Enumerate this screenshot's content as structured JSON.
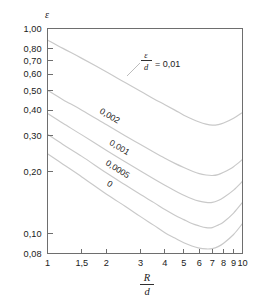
{
  "chart_data": {
    "type": "line",
    "title": "",
    "xlabel": "R/d",
    "ylabel": "ε",
    "xscale": "log",
    "yscale": "log",
    "xlim": [
      1,
      10
    ],
    "ylim": [
      0.08,
      1.0
    ],
    "grid": false,
    "legend_position": "inline-curve-labels",
    "x_tick_labels": [
      "1",
      "1,5",
      "2",
      "3",
      "4",
      "5",
      "6",
      "7",
      "8",
      "9",
      "10"
    ],
    "x_tick_values": [
      1,
      1.5,
      2,
      3,
      4,
      5,
      6,
      7,
      8,
      9,
      10
    ],
    "y_tick_labels": [
      "0,08",
      "0,10",
      "0,20",
      "0,30",
      "0,40",
      "0,50",
      "0,60",
      "0,70",
      "0,80",
      "1,00"
    ],
    "y_tick_values": [
      0.08,
      0.1,
      0.2,
      0.3,
      0.4,
      0.5,
      0.6,
      0.7,
      0.8,
      1.0
    ],
    "series": [
      {
        "name": "0,01",
        "label": "0,01",
        "label_prefix": "ε/d =",
        "x": [
          1,
          1.2,
          1.5,
          2,
          2.5,
          3,
          3.5,
          4,
          4.5,
          5,
          5.5,
          6,
          6.5,
          7,
          7.5,
          8,
          9,
          10
        ],
        "y": [
          0.88,
          0.8,
          0.715,
          0.615,
          0.545,
          0.495,
          0.455,
          0.425,
          0.4,
          0.378,
          0.362,
          0.35,
          0.342,
          0.338,
          0.34,
          0.346,
          0.365,
          0.39
        ]
      },
      {
        "name": "0,002",
        "label": "0,002",
        "x": [
          1,
          1.2,
          1.5,
          2,
          2.5,
          3,
          3.5,
          4,
          4.5,
          5,
          5.5,
          6,
          6.5,
          7,
          7.5,
          8,
          9,
          10
        ],
        "y": [
          0.5,
          0.45,
          0.4,
          0.34,
          0.3,
          0.272,
          0.25,
          0.233,
          0.22,
          0.21,
          0.202,
          0.196,
          0.193,
          0.192,
          0.194,
          0.199,
          0.212,
          0.23
        ]
      },
      {
        "name": "0,001",
        "label": "0,001",
        "x": [
          1,
          1.2,
          1.5,
          2,
          2.5,
          3,
          3.5,
          4,
          4.5,
          5,
          5.5,
          6,
          6.5,
          7,
          7.5,
          8,
          9,
          10
        ],
        "y": [
          0.385,
          0.345,
          0.303,
          0.255,
          0.224,
          0.202,
          0.185,
          0.172,
          0.162,
          0.154,
          0.148,
          0.144,
          0.142,
          0.142,
          0.145,
          0.15,
          0.163,
          0.18
        ]
      },
      {
        "name": "0,0005",
        "label": "0,0005",
        "x": [
          1,
          1.2,
          1.5,
          2,
          2.5,
          3,
          3.5,
          4,
          4.5,
          5,
          5.5,
          6,
          6.5,
          7,
          7.5,
          8,
          9,
          10
        ],
        "y": [
          0.305,
          0.272,
          0.238,
          0.198,
          0.173,
          0.155,
          0.142,
          0.131,
          0.123,
          0.117,
          0.112,
          0.109,
          0.107,
          0.107,
          0.11,
          0.114,
          0.126,
          0.142
        ]
      },
      {
        "name": "0",
        "label": "0",
        "x": [
          1,
          1.2,
          1.5,
          2,
          2.5,
          3,
          3.5,
          4,
          4.5,
          5,
          5.5,
          6,
          6.5,
          7,
          7.5,
          8,
          9,
          10
        ],
        "y": [
          0.245,
          0.218,
          0.189,
          0.156,
          0.136,
          0.121,
          0.11,
          0.101,
          0.0952,
          0.0903,
          0.0871,
          0.085,
          0.0842,
          0.0845,
          0.0864,
          0.0898,
          0.099,
          0.112
        ]
      }
    ],
    "annotations": [
      {
        "name": "roughness-ratio-annotation",
        "numerator": "ε",
        "denominator": "d",
        "equals": "= 0,01",
        "leader": true
      }
    ]
  },
  "axis": {
    "y_symbol": "ε",
    "x_numerator": "R",
    "x_denominator": "d"
  },
  "colors": {
    "curve": "#c9c9c9",
    "frame": "#6e6e6e",
    "text": "#1a1a1a",
    "background": "#ffffff"
  }
}
